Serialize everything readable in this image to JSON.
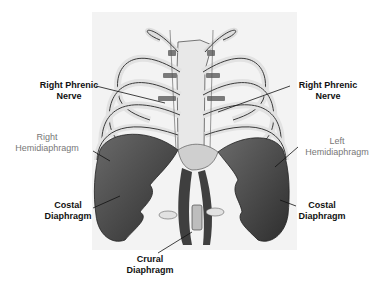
{
  "diagram": {
    "labels": {
      "right_phrenic_nerve_left": {
        "line1": "Right Phrenic",
        "line2": "Nerve"
      },
      "right_phrenic_nerve_right": {
        "line1": "Right Phrenic",
        "line2": "Nerve"
      },
      "right_hemidiaphragm": {
        "line1": "Right",
        "line2": "Hemidiaphragm"
      },
      "left_hemidiaphragm": {
        "line1": "Left",
        "line2": "Hemidiaphragm"
      },
      "costal_diaphragm_left": {
        "line1": "Costal",
        "line2": "Diaphragm"
      },
      "costal_diaphragm_right": {
        "line1": "Costal",
        "line2": "Diaphragm"
      },
      "crural_diaphragm": {
        "line1": "Crural",
        "line2": "Diaphragm"
      }
    },
    "colors": {
      "background": "#ffffff",
      "panel": "#f3f3f3",
      "bone": "#e6e6e6",
      "bone_outline": "#3a3a3a",
      "muscle": "#555555",
      "muscle_dark": "#333333",
      "cartilage": "#7a7a7a",
      "bold_label": "#111111",
      "light_label": "#777777"
    }
  }
}
